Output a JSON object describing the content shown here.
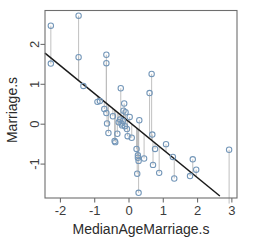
{
  "chart_data": {
    "type": "scatter",
    "title": "",
    "xlabel": "MedianAgeMarriage.s",
    "ylabel": "Marriage.s",
    "xlim": [
      -2.45,
      3.15
    ],
    "ylim": [
      -1.85,
      2.85
    ],
    "xticks": [
      -2,
      -1,
      0,
      1,
      2,
      3
    ],
    "xtick_labels": [
      "-2",
      "-1",
      "0",
      "1",
      "2",
      "3"
    ],
    "yticks": [
      2,
      1,
      0,
      -1
    ],
    "ytick_labels": [
      "2",
      "1",
      "0",
      "-1"
    ],
    "grid": false,
    "legend": "none",
    "point_color": "#7396b8",
    "point_fill": "none",
    "residual_color": "#b9b9b9",
    "line_color": "#1a1a1a",
    "frame_color": "#6e6e6e",
    "fit_line": {
      "name": "regression-line",
      "x": [
        -2.45,
        2.65
      ],
      "y": [
        1.78,
        -1.8
      ],
      "slope": -0.702,
      "intercept": 0.058
    },
    "points": [
      {
        "x": -2.28,
        "y": 2.47,
        "fit": 1.66
      },
      {
        "x": -2.28,
        "y": 1.52,
        "fit": 1.66
      },
      {
        "x": -1.47,
        "y": 2.72,
        "fit": 1.09
      },
      {
        "x": -1.47,
        "y": 1.68,
        "fit": 1.09
      },
      {
        "x": -1.33,
        "y": 0.96,
        "fit": 0.99
      },
      {
        "x": -0.92,
        "y": 0.56,
        "fit": 0.7
      },
      {
        "x": -0.85,
        "y": 0.58,
        "fit": 0.65
      },
      {
        "x": -0.72,
        "y": 0.38,
        "fit": 0.56
      },
      {
        "x": -0.66,
        "y": 1.74,
        "fit": 0.52
      },
      {
        "x": -0.66,
        "y": 1.53,
        "fit": 0.52
      },
      {
        "x": -0.66,
        "y": 0.28,
        "fit": 0.52
      },
      {
        "x": -0.64,
        "y": 0.02,
        "fit": 0.51
      },
      {
        "x": -0.6,
        "y": -0.22,
        "fit": 0.48
      },
      {
        "x": -0.47,
        "y": 0.2,
        "fit": 0.39
      },
      {
        "x": -0.42,
        "y": -0.42,
        "fit": 0.35
      },
      {
        "x": -0.4,
        "y": -0.45,
        "fit": 0.34
      },
      {
        "x": -0.34,
        "y": -0.24,
        "fit": 0.3
      },
      {
        "x": -0.3,
        "y": 0.05,
        "fit": 0.27
      },
      {
        "x": -0.26,
        "y": 0.12,
        "fit": 0.24
      },
      {
        "x": -0.24,
        "y": 0.9,
        "fit": 0.23
      },
      {
        "x": -0.22,
        "y": 0.02,
        "fit": 0.21
      },
      {
        "x": -0.2,
        "y": -0.03,
        "fit": 0.2
      },
      {
        "x": -0.18,
        "y": 0.08,
        "fit": 0.18
      },
      {
        "x": -0.16,
        "y": 0.34,
        "fit": 0.17
      },
      {
        "x": -0.14,
        "y": 0.52,
        "fit": 0.16
      },
      {
        "x": -0.12,
        "y": -0.05,
        "fit": 0.14
      },
      {
        "x": -0.1,
        "y": 0.3,
        "fit": 0.13
      },
      {
        "x": -0.06,
        "y": -0.12,
        "fit": 0.1
      },
      {
        "x": -0.04,
        "y": -0.3,
        "fit": 0.09
      },
      {
        "x": 0.02,
        "y": 0.18,
        "fit": 0.04
      },
      {
        "x": 0.08,
        "y": -0.34,
        "fit": 0.0
      },
      {
        "x": 0.22,
        "y": -0.62,
        "fit": -0.1
      },
      {
        "x": 0.24,
        "y": -1.24,
        "fit": -0.11
      },
      {
        "x": 0.26,
        "y": -0.78,
        "fit": -0.13
      },
      {
        "x": 0.26,
        "y": -0.84,
        "fit": -0.13
      },
      {
        "x": 0.28,
        "y": -0.92,
        "fit": -0.14
      },
      {
        "x": 0.28,
        "y": -1.72,
        "fit": -0.14
      },
      {
        "x": 0.3,
        "y": 0.1,
        "fit": -0.15
      },
      {
        "x": 0.44,
        "y": -0.86,
        "fit": -0.25
      },
      {
        "x": 0.6,
        "y": 0.78,
        "fit": -0.36
      },
      {
        "x": 0.66,
        "y": 1.26,
        "fit": -0.41
      },
      {
        "x": 0.68,
        "y": -0.26,
        "fit": -0.42
      },
      {
        "x": 0.7,
        "y": -1.02,
        "fit": -0.43
      },
      {
        "x": 0.76,
        "y": -0.62,
        "fit": -0.47
      },
      {
        "x": 0.88,
        "y": -1.22,
        "fit": -0.56
      },
      {
        "x": 1.08,
        "y": -0.5,
        "fit": -0.7
      },
      {
        "x": 1.28,
        "y": -0.82,
        "fit": -0.84
      },
      {
        "x": 1.32,
        "y": -1.36,
        "fit": -0.87
      },
      {
        "x": 1.78,
        "y": -1.3,
        "fit": -1.19
      },
      {
        "x": 1.86,
        "y": -0.88,
        "fit": -1.25
      },
      {
        "x": 1.96,
        "y": -1.14,
        "fit": -1.32
      },
      {
        "x": 2.92,
        "y": -0.64,
        "fit": -1.99
      }
    ]
  }
}
